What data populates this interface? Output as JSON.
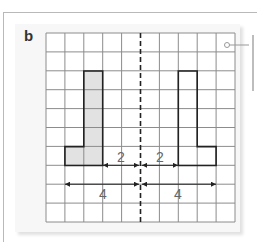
{
  "figure": {
    "panel_label": "b",
    "grid": {
      "columns": 10,
      "rows": 10,
      "origin_x": 46,
      "origin_y": 33,
      "cell_size": 18.9
    },
    "mirror_line": {
      "style": "dashed",
      "column_index": 5
    },
    "shapes": [
      {
        "name": "original-L",
        "fill": "#e2e2e2",
        "cells": "col 2 rows 2-6, col 1 row 6"
      },
      {
        "name": "reflected-L",
        "fill": "none",
        "cells": "col 7 rows 2-6, col 8 row 6"
      }
    ],
    "dimensions": [
      {
        "label": "2",
        "from": "left shape edge",
        "to": "mirror line"
      },
      {
        "label": "2",
        "from": "mirror line",
        "to": "right shape edge"
      },
      {
        "label": "4",
        "from": "left shape far edge",
        "to": "mirror line"
      },
      {
        "label": "4",
        "from": "mirror line",
        "to": "right shape far edge"
      }
    ],
    "labels": {
      "dim_left_short": "2",
      "dim_right_short": "2",
      "dim_left_long": "4",
      "dim_right_long": "4"
    },
    "colors": {
      "grid_line": "#8c8c8c",
      "shape_outline": "#222222",
      "shape_fill": "#e2e2e2",
      "panel_bg": "#f7f7f7"
    }
  }
}
